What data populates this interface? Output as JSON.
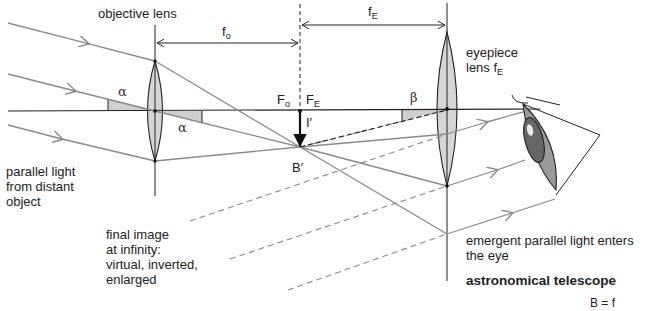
{
  "title": "astronomical telescope",
  "labels": {
    "objective_lens": "objective  lens",
    "f_o_main": "f",
    "f_o_sub": "o",
    "f_E_main": "f",
    "f_E_sub": "E",
    "eyepiece": "eyepiece\nlens f",
    "eyepiece_sub": "E",
    "F_o_main": "F",
    "F_o_sub": "o",
    "F_E_main": "F",
    "F_E_sub": "E",
    "alpha_1": "α",
    "alpha_2": "α",
    "beta": "β",
    "image_height": "I′",
    "image_point": "B′",
    "parallel_light": "parallel light\nfrom distant\nobject",
    "final_image": "final image\nat infinity:\nvirtual, inverted,\nenlarged",
    "emergent": "emergent parallel light enters\nthe eye",
    "caption": "astronomical telescope",
    "formula_partial": "B = f"
  },
  "colors": {
    "ray": "#8a8a8a",
    "lens_fill": "#d6d6d6",
    "outline": "#222222",
    "angle_fill": "#cfcfcf",
    "eye_fill": "#9a9a9a"
  }
}
